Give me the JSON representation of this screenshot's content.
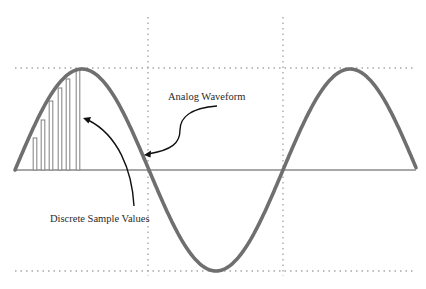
{
  "diagram": {
    "labels": {
      "analog": "Analog Waveform",
      "discrete": "Discrete Sample Values"
    },
    "colors": {
      "waveform": "#6f6f6f",
      "baseline": "#8a8a8a",
      "grid": "#a8a8a8",
      "bars": "#8a8a8a",
      "arrow": "#111111",
      "text": "#2a2a2a"
    },
    "geometry": {
      "baseline_y": 170,
      "x_start": 15,
      "x_end": 416,
      "amplitude": 101,
      "period": 268,
      "grid_h_y": [
        68,
        271
      ],
      "grid_v_x": [
        148,
        283
      ],
      "grid_v_range": [
        17,
        276
      ]
    },
    "samples": [
      {
        "x": 35,
        "top": 138
      },
      {
        "x": 43,
        "top": 120
      },
      {
        "x": 51,
        "top": 101
      },
      {
        "x": 60,
        "top": 88
      },
      {
        "x": 68,
        "top": 79
      },
      {
        "x": 78,
        "top": 70
      }
    ]
  }
}
